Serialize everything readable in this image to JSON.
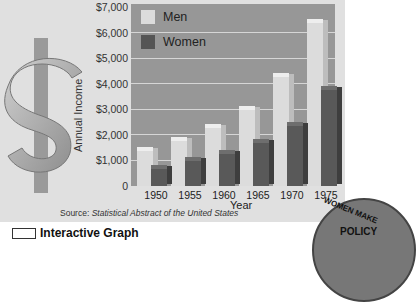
{
  "chart_data": {
    "type": "bar",
    "title": "",
    "xlabel": "Year",
    "ylabel": "Annual Income",
    "categories": [
      "1950",
      "1955",
      "1960",
      "1965",
      "1970",
      "1975"
    ],
    "series": [
      {
        "name": "Men",
        "color": "#dcdcdc",
        "values": [
          1400,
          1800,
          2300,
          3000,
          4300,
          6400
        ]
      },
      {
        "name": "Women",
        "color": "#555555",
        "values": [
          700,
          1000,
          1300,
          1700,
          2400,
          3800
        ]
      }
    ],
    "yticks": [
      "0",
      "$1,000",
      "$2,000",
      "$3,000",
      "$4,000",
      "$5,000",
      "$6,000",
      "$7,000"
    ],
    "ylim": [
      0,
      7000
    ],
    "grid": true,
    "legend_position": "top-left inside plot",
    "source": "Statistical Abstract of the United States",
    "source_prefix": "Source:"
  },
  "decor": {
    "dollar_icon": "dollar-sign",
    "badge_text_top": "WOMEN MAKE",
    "badge_text_bottom": "POLICY"
  },
  "footer": {
    "title": "Interactive Graph"
  }
}
